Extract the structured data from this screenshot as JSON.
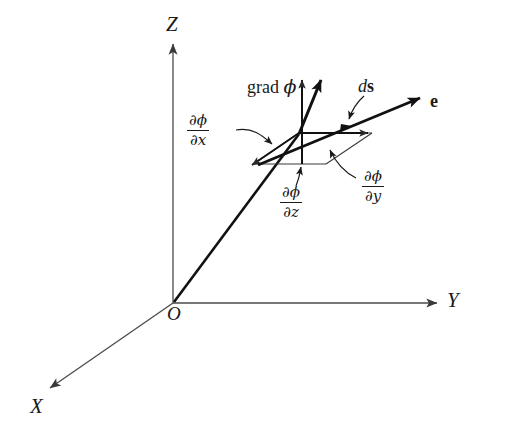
{
  "figure": {
    "background_color": "#ffffff",
    "ink_color": "#1a1a1a",
    "axis_color": "#4a4a4a",
    "axes": {
      "z": {
        "label": "Z"
      },
      "y": {
        "label": "Y"
      },
      "x": {
        "label": "X"
      },
      "origin": {
        "label": "O"
      }
    },
    "vectors": {
      "gradient": {
        "label_text": "grad ",
        "label_symbol": "ϕ"
      },
      "displacement": {
        "label_d": "d",
        "label_s": "s"
      },
      "unit": {
        "label": "e"
      }
    },
    "components": {
      "dx": {
        "numerator_partial": "∂",
        "numerator_symbol": "ϕ",
        "denominator_partial": "∂",
        "denominator_var": "x"
      },
      "dy": {
        "numerator_partial": "∂",
        "numerator_symbol": "ϕ",
        "denominator_partial": "∂",
        "denominator_var": "y"
      },
      "dz": {
        "numerator_partial": "∂",
        "numerator_symbol": "ϕ",
        "denominator_partial": "∂",
        "denominator_var": "z"
      }
    }
  }
}
